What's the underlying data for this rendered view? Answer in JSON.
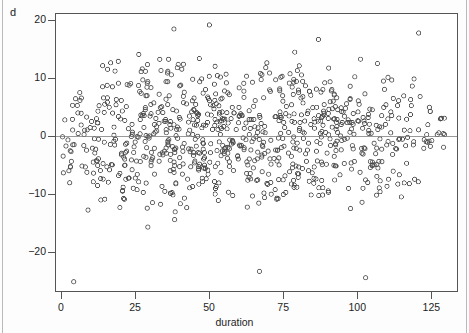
{
  "panel": {
    "label": "d"
  },
  "axes": {
    "x": {
      "title": "duration",
      "ticks": [
        0,
        25,
        50,
        75,
        100,
        125
      ],
      "tick_labels": [
        "0",
        "25",
        "50",
        "75",
        "100",
        "125"
      ],
      "range": [
        -2,
        134
      ]
    },
    "y": {
      "title": "Schoenfeld Residual for age_mean",
      "ticks": [
        20,
        10,
        0,
        -10,
        -20
      ],
      "tick_labels": [
        "20",
        "10",
        "0",
        "−10",
        "−20"
      ],
      "range": [
        -26.8,
        21.2
      ]
    }
  },
  "style": {
    "point_color": "#4d4d4d",
    "point_radius": 2.1,
    "point_stroke": 0.85,
    "frame_color": "#555555",
    "reference_line_color": "#777777",
    "background": "#ffffff"
  },
  "chart_data": {
    "type": "scatter",
    "title": "",
    "xlabel": "duration",
    "ylabel": "Schoenfeld Residual for age_mean",
    "xlim": [
      -2,
      134
    ],
    "ylim": [
      -26.8,
      21.2
    ],
    "grid": false,
    "legend": "none",
    "marker": "open-circle",
    "n_points": 880,
    "reference_lines": [
      {
        "orientation": "horizontal",
        "y": 0,
        "style": "solid"
      }
    ],
    "density_profile": {
      "description": "Dense residual cloud centred on 0 spanning full duration range; spread roughly -12 to +12 with the bulk between -8 and +8; point density highest for duration 20-100 and thins markedly beyond 120.",
      "x_bins": [
        0,
        10,
        20,
        30,
        40,
        50,
        60,
        70,
        80,
        90,
        100,
        110,
        120,
        130
      ],
      "counts": [
        38,
        62,
        80,
        92,
        86,
        84,
        78,
        80,
        76,
        72,
        60,
        42,
        24,
        6
      ],
      "spread_sd": [
        6.4,
        6.2,
        6.3,
        6.5,
        6.3,
        6.2,
        6.1,
        6.0,
        5.9,
        5.8,
        5.6,
        5.4,
        5.2,
        4.6
      ]
    },
    "outliers": [
      {
        "x": 4,
        "y": -25.2
      },
      {
        "x": 67,
        "y": -23.4
      },
      {
        "x": 103,
        "y": -24.5
      },
      {
        "x": 50,
        "y": 19.3
      },
      {
        "x": 38,
        "y": 18.6
      },
      {
        "x": 121,
        "y": 17.9
      },
      {
        "x": 87,
        "y": 16.8
      }
    ]
  }
}
